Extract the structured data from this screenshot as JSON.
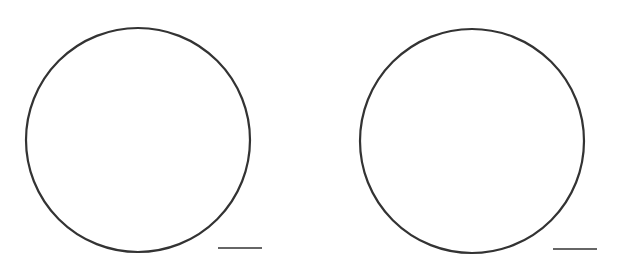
{
  "canvas": {
    "width": 629,
    "height": 279,
    "background": "#ffffff"
  },
  "stroke_color": "#333333",
  "figures": [
    {
      "id": "left",
      "circle": {
        "cx": 138,
        "cy": 140,
        "r": 112,
        "stroke_width": 2.2
      },
      "line": {
        "x1": 218,
        "y1": 248,
        "x2": 262,
        "y2": 248,
        "stroke_width": 1.5
      }
    },
    {
      "id": "right",
      "circle": {
        "cx": 472,
        "cy": 141,
        "r": 112,
        "stroke_width": 2.2
      },
      "line": {
        "x1": 553,
        "y1": 249,
        "x2": 597,
        "y2": 249,
        "stroke_width": 1.5
      }
    }
  ]
}
